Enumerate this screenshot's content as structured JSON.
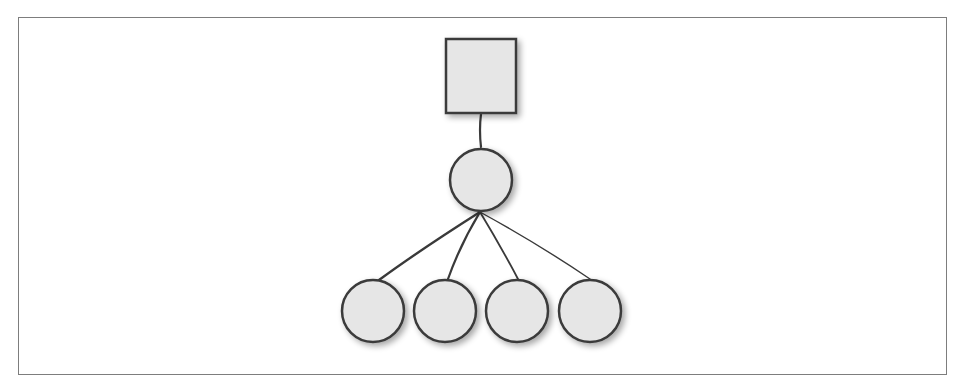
{
  "diagram": {
    "type": "tree",
    "colors": {
      "frame": "#7d7d7d",
      "stroke": "#3a3a3a",
      "fill": "#e6e6e6",
      "shadow": "#bdbdbd"
    },
    "root": {
      "shape": "square",
      "label": ""
    },
    "middle": {
      "shape": "circle",
      "label": ""
    },
    "leaves": [
      {
        "shape": "circle",
        "label": ""
      },
      {
        "shape": "circle",
        "label": ""
      },
      {
        "shape": "circle",
        "label": ""
      },
      {
        "shape": "circle",
        "label": ""
      }
    ],
    "edges": [
      {
        "from": "root",
        "to": "middle"
      },
      {
        "from": "middle",
        "to": "leaf-1"
      },
      {
        "from": "middle",
        "to": "leaf-2"
      },
      {
        "from": "middle",
        "to": "leaf-3"
      },
      {
        "from": "middle",
        "to": "leaf-4"
      }
    ]
  }
}
